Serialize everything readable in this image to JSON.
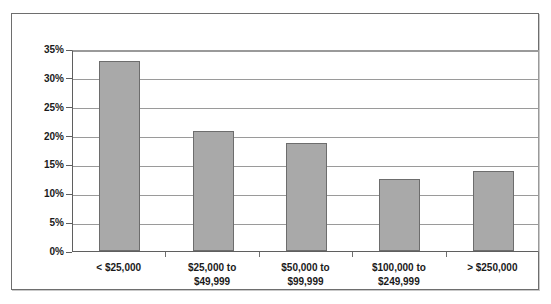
{
  "chart_data": {
    "type": "bar",
    "title": "",
    "subtitle": "",
    "xlabel": "",
    "ylabel": "",
    "categories": [
      "< $25,000",
      "$25,000 to\n$49,999",
      "$50,000 to\n$99,999",
      "$100,000 to\n$249,999",
      "> $250,000"
    ],
    "values": [
      33.0,
      20.8,
      18.7,
      12.5,
      13.9
    ],
    "value_labels": [
      "33%",
      "20.8%",
      "18.7%",
      "12.5%",
      "13.9%"
    ],
    "ylim": [
      0,
      35
    ],
    "ytick_values": [
      0,
      5,
      10,
      15,
      20,
      25,
      30,
      35
    ],
    "ytick_labels": [
      "0%",
      "5%",
      "10%",
      "15%",
      "20%",
      "25%",
      "30%",
      "35%"
    ],
    "grid": true,
    "grid_axis": "y",
    "legend": false,
    "legend_position": "none",
    "series": [
      {
        "name": "",
        "values": [
          33.0,
          20.8,
          18.7,
          12.5,
          13.9
        ]
      }
    ]
  },
  "style": {
    "bar_fill": "#a9a9a9",
    "bar_border": "#6d6d6d",
    "gridline_color": "#9a9a9a",
    "axis_color": "#5f5f5f",
    "frame_color": "#6e6e6e",
    "text_color": "#1a1a1a",
    "background": "#ffffff"
  }
}
